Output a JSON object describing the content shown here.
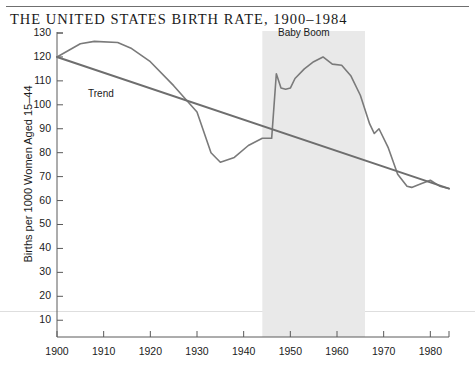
{
  "figure": {
    "title": "THE UNITED STATES BIRTH RATE, 1900–1984",
    "ylabel": "Births per 1000 Women Aged 15–44",
    "xlabel": ""
  },
  "annotations": {
    "trend": "Trend",
    "baby_boom": "Baby Boom"
  },
  "colors": {
    "line": "#7a7a7a",
    "trend": "#6e6e6e",
    "band": "#e9e9e9",
    "axis": "#5a5a5a",
    "text": "#1b1b1b",
    "rule": "#6f6f6f",
    "faint_rule": "#dedede"
  },
  "chart_data": {
    "type": "line",
    "title": "THE UNITED STATES BIRTH RATE, 1900–1984",
    "xlabel": "",
    "ylabel": "Births per 1000 Women Aged 15–44",
    "xlim": [
      1900,
      1984
    ],
    "ylim": [
      3,
      130
    ],
    "grid": false,
    "legend": "none",
    "yticks": [
      10,
      20,
      30,
      40,
      50,
      60,
      70,
      80,
      90,
      100,
      110,
      120,
      130
    ],
    "xticks": [
      1900,
      1910,
      1920,
      1930,
      1940,
      1950,
      1960,
      1970,
      1980
    ],
    "shaded_region": {
      "label": "Baby Boom",
      "x_start": 1944,
      "x_end": 1966,
      "color": "#e9e9e9"
    },
    "series": [
      {
        "name": "Birth rate",
        "x": [
          1900,
          1905,
          1908,
          1913,
          1916,
          1920,
          1925,
          1930,
          1933,
          1935,
          1938,
          1941,
          1944,
          1946,
          1947,
          1948,
          1949,
          1950,
          1951,
          1953,
          1955,
          1957,
          1959,
          1961,
          1963,
          1965,
          1967,
          1968,
          1969,
          1971,
          1973,
          1975,
          1976,
          1978,
          1980,
          1982,
          1984
        ],
        "y": [
          120,
          125.5,
          126.5,
          126,
          123.5,
          118,
          108,
          97,
          80,
          76,
          78,
          83,
          86,
          86,
          113,
          107,
          106.5,
          107,
          111,
          115,
          118,
          120,
          117,
          116.5,
          112,
          104,
          92,
          88,
          90,
          82,
          71,
          66,
          65.5,
          67,
          68.5,
          66,
          65
        ],
        "color": "#7a7a7a"
      },
      {
        "name": "Trend",
        "x": [
          1900,
          1984
        ],
        "y": [
          120,
          65
        ],
        "color": "#6e6e6e"
      }
    ]
  }
}
